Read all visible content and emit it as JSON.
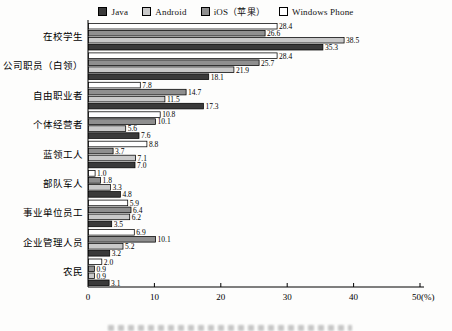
{
  "chart_data": {
    "type": "bar",
    "orientation": "horizontal",
    "title": "",
    "xlabel": "",
    "ylabel": "",
    "xlim": [
      0,
      50
    ],
    "x_ticks": [
      {
        "value": 0,
        "label": "0"
      },
      {
        "value": 10,
        "label": "10"
      },
      {
        "value": 20,
        "label": "20"
      },
      {
        "value": 30,
        "label": "30"
      },
      {
        "value": 40,
        "label": "40"
      },
      {
        "value": 50,
        "label": "50(%)"
      }
    ],
    "grid": false,
    "legend_position": "top",
    "categories": [
      "在校学生",
      "公司职员（白领）",
      "自由职业者",
      "个体经营者",
      "蓝领工人",
      "部队军人",
      "事业单位员工",
      "企业管理人员",
      "农民"
    ],
    "series": [
      {
        "name": "Java",
        "color": "#3a3a3a",
        "values": [
          35.3,
          18.1,
          17.3,
          7.6,
          7.0,
          4.8,
          3.5,
          3.2,
          3.1
        ]
      },
      {
        "name": "Android",
        "color": "#c9c9c9",
        "values": [
          38.5,
          21.9,
          11.5,
          5.6,
          7.1,
          3.3,
          6.2,
          5.2,
          0.9
        ]
      },
      {
        "name": "iOS（苹果）",
        "color": "#8f8f8f",
        "values": [
          26.6,
          25.7,
          14.7,
          10.1,
          3.7,
          1.8,
          6.4,
          10.1,
          0.9
        ]
      },
      {
        "name": "Windows Phone",
        "color": "#ffffff",
        "values": [
          28.4,
          28.4,
          7.8,
          10.8,
          8.8,
          1.0,
          5.9,
          6.9,
          2.0
        ]
      }
    ],
    "bar_order_top_to_bottom": [
      "Windows Phone",
      "iOS（苹果）",
      "Android",
      "Java"
    ],
    "value_labels_shown": true,
    "axis_color": "#000000",
    "bar_border_color": "#000000"
  }
}
